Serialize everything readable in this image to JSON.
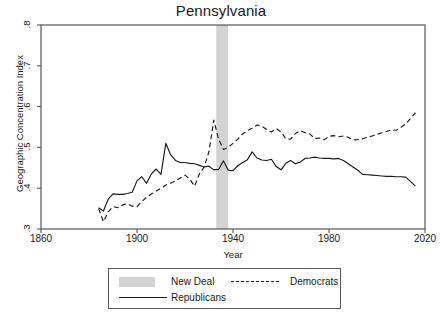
{
  "chart_data": {
    "type": "line",
    "title": "Pennsylvania",
    "xlabel": "Year",
    "ylabel": "Geographic Concentration Index",
    "xlim": [
      1860,
      2020
    ],
    "ylim": [
      0.3,
      0.8
    ],
    "xticks": [
      "1860",
      "1900",
      "1940",
      "1980",
      "2020"
    ],
    "xtick_values": [
      1860,
      1900,
      1940,
      1980,
      2020
    ],
    "yticks": [
      ".3",
      ".4",
      ".5",
      ".6",
      ".7",
      ".8"
    ],
    "ytick_values": [
      0.3,
      0.4,
      0.5,
      0.6,
      0.7,
      0.8
    ],
    "grid": false,
    "legend_position": "below",
    "shaded_region": {
      "label": "New Deal",
      "x_start": 1933,
      "x_end": 1938,
      "color": "#d3d3d3"
    },
    "series": [
      {
        "name": "Republicans",
        "style": "solid",
        "color": "#1a1a1a",
        "x": [
          1884,
          1886,
          1888,
          1890,
          1892,
          1894,
          1896,
          1898,
          1900,
          1902,
          1904,
          1906,
          1908,
          1910,
          1912,
          1914,
          1916,
          1918,
          1920,
          1922,
          1924,
          1926,
          1928,
          1930,
          1932,
          1934,
          1936,
          1938,
          1940,
          1942,
          1944,
          1946,
          1948,
          1950,
          1952,
          1954,
          1956,
          1958,
          1960,
          1962,
          1964,
          1966,
          1968,
          1970,
          1972,
          1974,
          1976,
          1978,
          1980,
          1982,
          1984,
          1986,
          1988,
          1990,
          1992,
          1994,
          1996,
          1998,
          2000,
          2002,
          2004,
          2006,
          2008,
          2010,
          2012,
          2014,
          2016
        ],
        "y": [
          0.352,
          0.344,
          0.373,
          0.386,
          0.385,
          0.385,
          0.387,
          0.39,
          0.418,
          0.428,
          0.412,
          0.435,
          0.447,
          0.434,
          0.51,
          0.482,
          0.468,
          0.463,
          0.463,
          0.461,
          0.46,
          0.456,
          0.452,
          0.454,
          0.445,
          0.446,
          0.467,
          0.444,
          0.443,
          0.455,
          0.463,
          0.47,
          0.489,
          0.474,
          0.469,
          0.468,
          0.471,
          0.453,
          0.445,
          0.461,
          0.468,
          0.46,
          0.464,
          0.473,
          0.474,
          0.476,
          0.474,
          0.473,
          0.473,
          0.472,
          0.473,
          0.468,
          0.46,
          0.452,
          0.444,
          0.434,
          0.433,
          0.432,
          0.431,
          0.43,
          0.429,
          0.429,
          0.428,
          0.428,
          0.427,
          0.416,
          0.405
        ]
      },
      {
        "name": "Democrats",
        "style": "dashed",
        "color": "#1a1a1a",
        "x": [
          1884,
          1886,
          1888,
          1890,
          1892,
          1894,
          1896,
          1898,
          1900,
          1902,
          1904,
          1906,
          1908,
          1910,
          1912,
          1914,
          1916,
          1918,
          1920,
          1922,
          1924,
          1926,
          1928,
          1930,
          1932,
          1934,
          1936,
          1938,
          1940,
          1942,
          1944,
          1946,
          1948,
          1950,
          1952,
          1954,
          1956,
          1958,
          1960,
          1962,
          1964,
          1966,
          1968,
          1970,
          1972,
          1974,
          1976,
          1978,
          1980,
          1982,
          1984,
          1986,
          1988,
          1990,
          1992,
          1994,
          1996,
          1998,
          2000,
          2002,
          2004,
          2006,
          2008,
          2010,
          2012,
          2014,
          2016
        ],
        "y": [
          0.35,
          0.318,
          0.342,
          0.355,
          0.352,
          0.359,
          0.362,
          0.356,
          0.355,
          0.367,
          0.378,
          0.386,
          0.393,
          0.4,
          0.408,
          0.412,
          0.418,
          0.425,
          0.432,
          0.422,
          0.405,
          0.435,
          0.452,
          0.49,
          0.567,
          0.52,
          0.495,
          0.5,
          0.51,
          0.52,
          0.533,
          0.541,
          0.547,
          0.555,
          0.552,
          0.544,
          0.538,
          0.546,
          0.538,
          0.521,
          0.52,
          0.534,
          0.541,
          0.536,
          0.533,
          0.522,
          0.523,
          0.519,
          0.527,
          0.529,
          0.526,
          0.528,
          0.525,
          0.518,
          0.519,
          0.521,
          0.525,
          0.528,
          0.532,
          0.536,
          0.539,
          0.543,
          0.542,
          0.549,
          0.558,
          0.571,
          0.585
        ]
      }
    ]
  },
  "legend": {
    "new_deal": "New Deal",
    "democrats": "Democrats",
    "republicans": "Republicans"
  }
}
